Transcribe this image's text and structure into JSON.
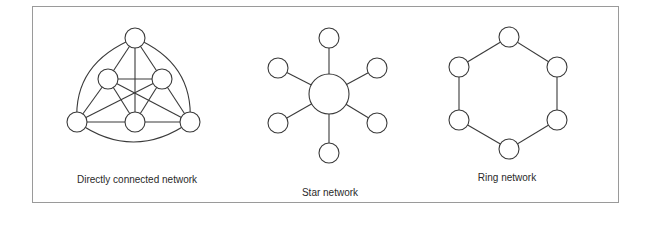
{
  "figure": {
    "border_color": "#9a9a9a",
    "stroke_color": "#3a3a3a"
  },
  "diagrams": [
    {
      "id": "directly-connected",
      "label": "Directly connected network",
      "label_pos": {
        "x": 137,
        "y": 174
      },
      "node_radius": 10,
      "nodes": [
        {
          "id": "top",
          "x": 135,
          "y": 38
        },
        {
          "id": "mid-left",
          "x": 108,
          "y": 79
        },
        {
          "id": "mid-right",
          "x": 162,
          "y": 79
        },
        {
          "id": "bottom-left",
          "x": 77,
          "y": 122
        },
        {
          "id": "bottom-center",
          "x": 135,
          "y": 122
        },
        {
          "id": "bottom-right",
          "x": 190,
          "y": 122
        }
      ],
      "edges": [
        [
          "top",
          "mid-left"
        ],
        [
          "top",
          "mid-right"
        ],
        [
          "top",
          "bottom-center"
        ],
        [
          "mid-left",
          "mid-right"
        ],
        [
          "mid-left",
          "bottom-left"
        ],
        [
          "mid-left",
          "bottom-center"
        ],
        [
          "mid-left",
          "bottom-right"
        ],
        [
          "mid-right",
          "bottom-right"
        ],
        [
          "mid-right",
          "bottom-center"
        ],
        [
          "mid-right",
          "bottom-left"
        ],
        [
          "bottom-left",
          "bottom-center"
        ],
        [
          "bottom-center",
          "bottom-right"
        ]
      ],
      "curved_edges": [
        [
          "top",
          "bottom-left"
        ],
        [
          "top",
          "bottom-right"
        ],
        [
          "bottom-left",
          "bottom-right"
        ]
      ]
    },
    {
      "id": "star",
      "label": "Star network",
      "label_pos": {
        "x": 330,
        "y": 187
      },
      "hub": {
        "id": "center",
        "x": 329,
        "y": 94,
        "r": 20
      },
      "node_radius": 10,
      "nodes": [
        {
          "id": "top",
          "x": 329,
          "y": 38
        },
        {
          "id": "upper-left",
          "x": 278,
          "y": 68
        },
        {
          "id": "upper-right",
          "x": 377,
          "y": 68
        },
        {
          "id": "lower-left",
          "x": 278,
          "y": 123
        },
        {
          "id": "lower-right",
          "x": 377,
          "y": 123
        },
        {
          "id": "bottom",
          "x": 329,
          "y": 153
        }
      ]
    },
    {
      "id": "ring",
      "label": "Ring network",
      "label_pos": {
        "x": 507,
        "y": 172
      },
      "node_radius": 10,
      "nodes": [
        {
          "id": "top",
          "x": 509,
          "y": 37
        },
        {
          "id": "upper-right",
          "x": 557,
          "y": 67
        },
        {
          "id": "lower-right",
          "x": 557,
          "y": 120
        },
        {
          "id": "bottom",
          "x": 509,
          "y": 149
        },
        {
          "id": "lower-left",
          "x": 459,
          "y": 120
        },
        {
          "id": "upper-left",
          "x": 459,
          "y": 67
        }
      ]
    }
  ]
}
